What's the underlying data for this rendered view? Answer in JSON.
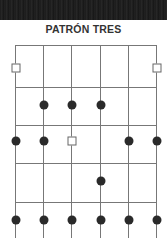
{
  "title": "PATRÓN TRES",
  "diagram": {
    "strings": 6,
    "frets_visible": 5,
    "string_x": [
      15,
      43,
      71,
      100,
      128,
      156
    ],
    "fret_y": [
      45,
      87,
      125,
      163,
      202
    ],
    "markers": [
      {
        "type": "square",
        "string": 0,
        "y": 68
      },
      {
        "type": "square",
        "string": 5,
        "y": 68
      },
      {
        "type": "dot",
        "string": 1,
        "y": 105
      },
      {
        "type": "dot",
        "string": 2,
        "y": 105
      },
      {
        "type": "dot",
        "string": 3,
        "y": 105
      },
      {
        "type": "dot",
        "string": 0,
        "y": 141
      },
      {
        "type": "dot",
        "string": 1,
        "y": 141
      },
      {
        "type": "square",
        "string": 2,
        "y": 141
      },
      {
        "type": "dot",
        "string": 4,
        "y": 141
      },
      {
        "type": "dot",
        "string": 5,
        "y": 141
      },
      {
        "type": "dot",
        "string": 3,
        "y": 181
      },
      {
        "type": "dot",
        "string": 0,
        "y": 220
      },
      {
        "type": "dot",
        "string": 1,
        "y": 220
      },
      {
        "type": "dot",
        "string": 2,
        "y": 220
      },
      {
        "type": "dot",
        "string": 3,
        "y": 220
      },
      {
        "type": "dot",
        "string": 4,
        "y": 220
      },
      {
        "type": "dot",
        "string": 5,
        "y": 220
      }
    ]
  }
}
